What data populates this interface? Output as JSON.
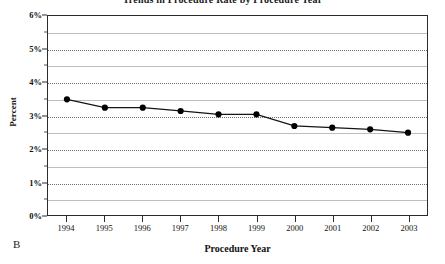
{
  "figure": {
    "panel_label": "B",
    "cropped_title": "Trends in Procedure Rate by Procedure Year"
  },
  "chart_data": {
    "type": "line",
    "title": "",
    "xlabel": "Procedure Year",
    "ylabel": "Percent",
    "categories": [
      "1994",
      "1995",
      "1996",
      "1997",
      "1998",
      "1999",
      "2000",
      "2001",
      "2002",
      "2003"
    ],
    "x": [
      1994,
      1995,
      1996,
      1997,
      1998,
      1999,
      2000,
      2001,
      2002,
      2003
    ],
    "values": [
      3.5,
      3.25,
      3.25,
      3.15,
      3.05,
      3.05,
      2.7,
      2.65,
      2.6,
      2.5
    ],
    "series": [
      {
        "name": "Percent",
        "values": [
          3.5,
          3.25,
          3.25,
          3.15,
          3.05,
          3.05,
          2.7,
          2.65,
          2.6,
          2.5
        ]
      }
    ],
    "ylim": [
      0,
      6
    ],
    "ytick_labels": [
      "0%",
      "1%",
      "2%",
      "3%",
      "4%",
      "5%",
      "6%"
    ],
    "ytick_values": [
      0,
      1,
      2,
      3,
      4,
      5,
      6
    ],
    "yminor_values": [
      0.5,
      1.5,
      2.5,
      3.5,
      4.5,
      5.5
    ],
    "xlim": [
      1993.5,
      2003.5
    ],
    "grid": true,
    "legend": false,
    "marker": "filled-circle",
    "line_color": "#141414",
    "marker_color": "#000000",
    "grid_color": "#6b6b6b",
    "frame_color": "#2b2b2b"
  }
}
